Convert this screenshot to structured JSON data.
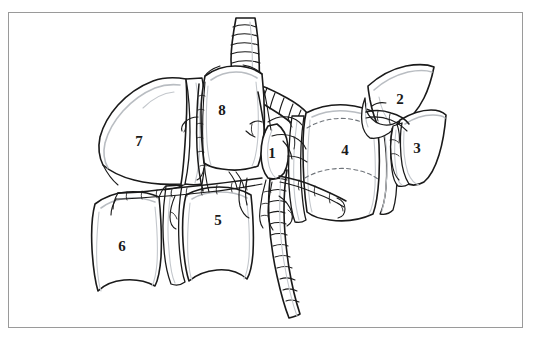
{
  "figure": {
    "background_color": "#ffffff",
    "ink_color": "#1a1a1a",
    "shade_color": "#b9bdc2",
    "frame": {
      "name": "figure-border",
      "color": "#9a9a9a",
      "x": 8,
      "y": 12,
      "width": 515,
      "height": 316,
      "stroke_width": 1.5
    }
  },
  "labels": [
    {
      "id": "segment-1",
      "text": "1",
      "x": 272,
      "y": 153
    },
    {
      "id": "segment-2",
      "text": "2",
      "x": 400,
      "y": 99
    },
    {
      "id": "segment-3",
      "text": "3",
      "x": 417,
      "y": 148
    },
    {
      "id": "segment-4",
      "text": "4",
      "x": 345,
      "y": 150
    },
    {
      "id": "segment-5",
      "text": "5",
      "x": 218,
      "y": 220
    },
    {
      "id": "segment-6",
      "text": "6",
      "x": 122,
      "y": 246
    },
    {
      "id": "segment-7",
      "text": "7",
      "x": 139,
      "y": 141
    },
    {
      "id": "segment-8",
      "text": "8",
      "x": 222,
      "y": 110
    }
  ],
  "structures": {
    "airway_trunk": "central ringed tube descending from top to bottom",
    "left_main_branch": "ringed tube angling down-left from carina",
    "right_main_branch": "ringed tube angling down-right from carina",
    "vessel_network": "thin branching vessel tree over central hilum"
  }
}
